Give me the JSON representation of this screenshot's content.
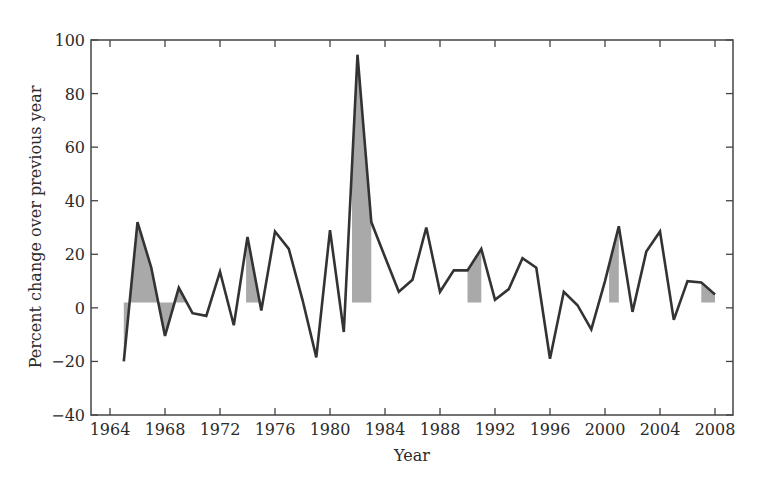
{
  "chart_data": {
    "type": "line",
    "title": "",
    "xlabel": "Year",
    "ylabel": "Percent change over previous year",
    "xlim": [
      1963.8,
      2009.2
    ],
    "ylim": [
      -40,
      100
    ],
    "xticks": [
      1964,
      1968,
      1972,
      1976,
      1980,
      1984,
      1988,
      1992,
      1996,
      2000,
      2004,
      2008
    ],
    "yticks": [
      -40,
      -20,
      0,
      20,
      40,
      60,
      80,
      100
    ],
    "grid": false,
    "legend": null,
    "x": [
      1965,
      1966,
      1967,
      1968,
      1969,
      1970,
      1971,
      1972,
      1973,
      1974,
      1975,
      1976,
      1977,
      1978,
      1979,
      1980,
      1981,
      1982,
      1983,
      1984,
      1985,
      1986,
      1987,
      1988,
      1989,
      1990,
      1991,
      1992,
      1993,
      1994,
      1995,
      1996,
      1997,
      1998,
      1999,
      2000,
      2001,
      2002,
      2003,
      2004,
      2005,
      2006,
      2007,
      2008
    ],
    "series": [
      {
        "name": "Percent change over previous year",
        "values": [
          -20,
          32,
          15,
          -10.5,
          7.5,
          -2,
          -3,
          13.5,
          -6.5,
          26.5,
          -1,
          28.5,
          22,
          3,
          -18.5,
          29,
          -9,
          94.5,
          32,
          19,
          6,
          10.5,
          30,
          6,
          14,
          14,
          22,
          3,
          7,
          18.5,
          15,
          -19,
          6,
          1,
          -8,
          10,
          30.5,
          -1.5,
          21,
          28.5,
          -4.5,
          10,
          9.5,
          5
        ],
        "color": "#333333"
      }
    ],
    "shaded_periods": [
      {
        "start": 1965,
        "end": 1969.5
      },
      {
        "start": 1973.9,
        "end": 1975
      },
      {
        "start": 1981.6,
        "end": 1983
      },
      {
        "start": 1990,
        "end": 1991
      },
      {
        "start": 2000.3,
        "end": 2001
      },
      {
        "start": 2007,
        "end": 2008
      }
    ],
    "shade_baseline": 2,
    "shade_color": "#a9a9a9"
  }
}
